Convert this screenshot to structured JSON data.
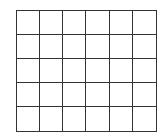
{
  "diagram": {
    "type": "grid",
    "rows": 5,
    "columns": 6,
    "line_color": "#333333",
    "background_color": "#ffffff",
    "cells_content": [
      [
        "",
        "",
        "",
        "",
        "",
        ""
      ],
      [
        "",
        "",
        "",
        "",
        "",
        ""
      ],
      [
        "",
        "",
        "",
        "",
        "",
        ""
      ],
      [
        "",
        "",
        "",
        "",
        "",
        ""
      ],
      [
        "",
        "",
        "",
        "",
        "",
        ""
      ]
    ]
  }
}
